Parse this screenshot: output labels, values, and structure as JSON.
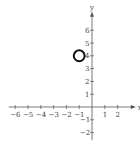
{
  "chart_data": {
    "type": "scatter",
    "title": "",
    "xlabel": "x",
    "ylabel": "y",
    "x_ticks": [
      -6,
      -5,
      -4,
      -3,
      -2,
      -1,
      1,
      2
    ],
    "y_ticks": [
      -2,
      -1,
      1,
      2,
      3,
      4,
      5,
      6
    ],
    "xlim": [
      -6.5,
      2.8
    ],
    "ylim": [
      -2.6,
      6.9
    ],
    "shapes": [
      {
        "type": "circle",
        "center": [
          -1,
          4
        ],
        "radius": 0.5
      }
    ],
    "grid": false
  }
}
